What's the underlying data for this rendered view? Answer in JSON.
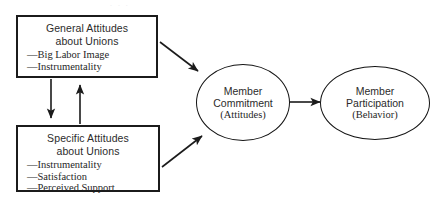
{
  "figure": {
    "kind": "path-model-diagram",
    "background_color": "#ffffff",
    "line_color": "#1b1b1b",
    "caption_artifact": ". . ."
  },
  "nodes": {
    "general_attitudes": {
      "shape": "rectangle",
      "title_line1": "General Attitudes",
      "title_line2": "about Unions",
      "bullets": [
        "Big Labor Image",
        "Instrumentality"
      ],
      "bullet_marker": "—"
    },
    "specific_attitudes": {
      "shape": "rectangle",
      "title_line1": "Specific Attitudes",
      "title_line2": "about Unions",
      "bullets": [
        "Instrumentality",
        "Satisfaction",
        "Perceived Support"
      ],
      "bullet_marker": "—"
    },
    "member_commitment": {
      "shape": "ellipse",
      "title_line1": "Member",
      "title_line2": "Commitment",
      "subtitle": "(Attitudes)"
    },
    "member_participation": {
      "shape": "ellipse",
      "title_line1": "Member",
      "title_line2": "Participation",
      "subtitle": "(Behavior)"
    }
  },
  "edges": [
    {
      "id": "general-to-specific",
      "from": "general_attitudes",
      "to": "specific_attitudes",
      "direction": "down",
      "style": "solid-arrow"
    },
    {
      "id": "specific-to-general",
      "from": "specific_attitudes",
      "to": "general_attitudes",
      "direction": "up",
      "style": "solid-arrow"
    },
    {
      "id": "general-to-commitment",
      "from": "general_attitudes",
      "to": "member_commitment",
      "direction": "down-right",
      "style": "solid-arrow"
    },
    {
      "id": "specific-to-commitment",
      "from": "specific_attitudes",
      "to": "member_commitment",
      "direction": "up-right",
      "style": "solid-arrow"
    },
    {
      "id": "commitment-to-participation",
      "from": "member_commitment",
      "to": "member_participation",
      "direction": "right",
      "style": "solid-arrow"
    }
  ]
}
